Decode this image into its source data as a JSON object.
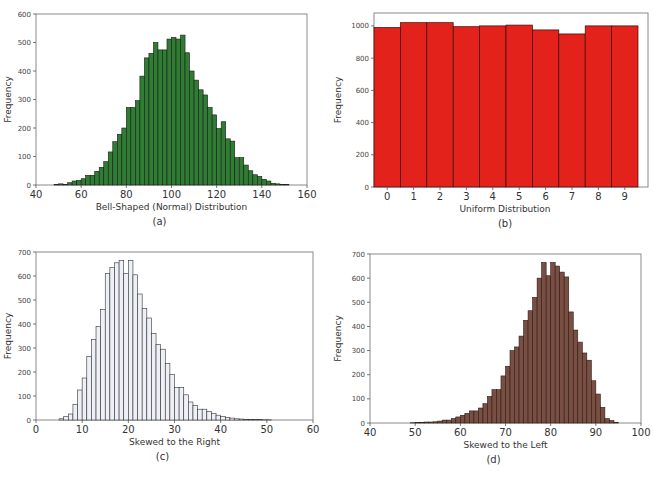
{
  "chart_data": [
    {
      "id": "a",
      "type": "bar",
      "subtype": "histogram",
      "caption": "(a)",
      "title": "",
      "xlabel": "Bell-Shaped (Normal) Distribution",
      "ylabel": "Frequency",
      "xlim": [
        40,
        160
      ],
      "ylim": [
        0,
        600
      ],
      "xticks": [
        40,
        60,
        80,
        100,
        120,
        140,
        160
      ],
      "yticks": [
        0,
        100,
        200,
        300,
        400,
        500,
        600
      ],
      "bin_start": 48,
      "bin_width": 2,
      "values": [
        2,
        4,
        2,
        8,
        14,
        16,
        22,
        34,
        34,
        48,
        62,
        82,
        116,
        152,
        178,
        200,
        272,
        272,
        296,
        382,
        446,
        462,
        500,
        474,
        474,
        512,
        518,
        512,
        526,
        464,
        400,
        368,
        334,
        316,
        272,
        246,
        198,
        222,
        162,
        154,
        96,
        96,
        70,
        50,
        36,
        30,
        20,
        14,
        6,
        4,
        2,
        2
      ],
      "fill_color": "#2e7d32",
      "edge_color": "#1a1a1a",
      "grid": false,
      "legend": null
    },
    {
      "id": "b",
      "type": "bar",
      "subtype": "histogram",
      "caption": "(b)",
      "title": "",
      "xlabel": "Uniform Distribution",
      "ylabel": "Frequency",
      "categories": [
        "0",
        "1",
        "2",
        "3",
        "4",
        "5",
        "6",
        "7",
        "8",
        "9"
      ],
      "values": [
        990,
        1020,
        1020,
        995,
        1000,
        1005,
        975,
        950,
        1000,
        1000
      ],
      "ylim": [
        0,
        1080
      ],
      "yticks": [
        0,
        200,
        400,
        600,
        800,
        1000
      ],
      "fill_color": "#e3231b",
      "edge_color": "#3a0a08",
      "grid": false,
      "legend": null
    },
    {
      "id": "c",
      "type": "bar",
      "subtype": "histogram",
      "caption": "(c)",
      "title": "",
      "xlabel": "Skewed to the Right",
      "ylabel": "Frequency",
      "xlim": [
        0,
        60
      ],
      "ylim": [
        0,
        700
      ],
      "xticks": [
        0,
        10,
        20,
        30,
        40,
        50,
        60
      ],
      "yticks": [
        0,
        100,
        200,
        300,
        400,
        500,
        600,
        700
      ],
      "bin_start": 5,
      "bin_width": 1,
      "values": [
        5,
        15,
        25,
        65,
        125,
        175,
        265,
        335,
        390,
        460,
        610,
        635,
        655,
        665,
        610,
        665,
        605,
        525,
        465,
        425,
        360,
        315,
        295,
        235,
        190,
        135,
        135,
        105,
        75,
        60,
        45,
        45,
        35,
        28,
        20,
        15,
        10,
        8,
        5,
        4,
        3,
        3,
        2,
        2,
        1,
        1
      ],
      "fill_color": "#eef0f8",
      "edge_color": "#333333",
      "grid": false,
      "legend": null
    },
    {
      "id": "d",
      "type": "bar",
      "subtype": "histogram",
      "caption": "(d)",
      "title": "",
      "xlabel": "Skewed to the Left",
      "ylabel": "Frequency",
      "xlim": [
        40,
        100
      ],
      "ylim": [
        0,
        700
      ],
      "xticks": [
        40,
        50,
        60,
        70,
        80,
        90,
        100
      ],
      "yticks": [
        0,
        100,
        200,
        300,
        400,
        500,
        600,
        700
      ],
      "bin_start": 49,
      "bin_width": 1,
      "values": [
        1,
        2,
        3,
        4,
        4,
        5,
        8,
        12,
        12,
        18,
        25,
        32,
        40,
        50,
        50,
        62,
        80,
        110,
        138,
        138,
        195,
        235,
        300,
        315,
        360,
        425,
        465,
        520,
        600,
        665,
        610,
        665,
        650,
        625,
        605,
        460,
        385,
        335,
        290,
        260,
        175,
        120,
        65,
        18,
        10,
        3
      ],
      "fill_color": "#7a4f43",
      "edge_color": "#2b1a14",
      "grid": false,
      "legend": null
    }
  ]
}
